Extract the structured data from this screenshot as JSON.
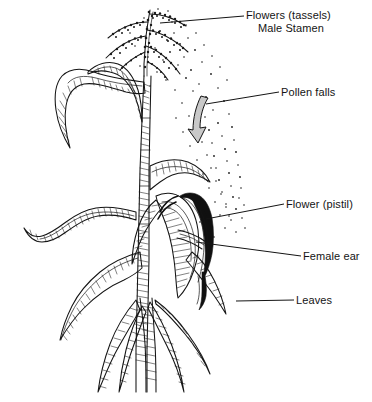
{
  "diagram": {
    "style": "black-and-white line drawing with hatching and stipple",
    "background_color": "#ffffff",
    "ink_color": "#141414",
    "arrow_fill_color": "#c9c9c9",
    "silk_color": "#101010",
    "canvas": {
      "width": 372,
      "height": 402
    }
  },
  "labels": [
    {
      "id": "flowers-tassels",
      "line1": "Flowers (tassels)",
      "line2": "Male Stamen",
      "x": 246,
      "y": 19,
      "leader": {
        "x1": 160,
        "y1": 23,
        "x2": 244,
        "y2": 16
      }
    },
    {
      "id": "pollen-falls",
      "line1": "Pollen falls",
      "line2": "",
      "x": 281,
      "y": 96,
      "leader": {
        "x1": 206,
        "y1": 104,
        "x2": 279,
        "y2": 92
      }
    },
    {
      "id": "flower-pistil",
      "line1": "Flower (pistil)",
      "line2": "",
      "x": 286,
      "y": 208,
      "leader": {
        "x1": 206,
        "y1": 219,
        "x2": 284,
        "y2": 204
      }
    },
    {
      "id": "female-ear",
      "line1": "Female ear",
      "line2": "",
      "x": 303,
      "y": 260,
      "leader": {
        "x1": 196,
        "y1": 242,
        "x2": 301,
        "y2": 256
      }
    },
    {
      "id": "leaves",
      "line1": "Leaves",
      "line2": "",
      "x": 296,
      "y": 304,
      "leader": {
        "x1": 236,
        "y1": 301,
        "x2": 294,
        "y2": 300
      }
    }
  ],
  "parts": {
    "tassel": "Feathery branched male inflorescence at the plant apex",
    "pollen": "Stippled dots drifting down and to the right of the tassel",
    "arrow": "Shaded curved arrow pointing down toward the ear",
    "stem": "Vertical hatched central stalk",
    "upper_leaves": "Two arching leaves near the top of the stem",
    "lower_leaves": "Long drooping hatched leaves at mid and lower stem",
    "ear": "Hatched husked ear on the right side of the stem",
    "silk": "Dark flowing silk strands emerging from the ear tip"
  }
}
